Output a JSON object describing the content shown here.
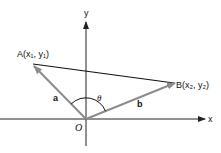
{
  "diagram": {
    "title": "",
    "axes": {
      "x_label": "x",
      "y_label": "y",
      "origin_label": "O"
    },
    "points": {
      "A": {
        "label": "A(x₁, y₁)"
      },
      "B": {
        "label": "B(x₂, y₂)"
      }
    },
    "vectors": {
      "a": {
        "label": "a",
        "from": "O",
        "to": "A"
      },
      "b": {
        "label": "b",
        "from": "O",
        "to": "B"
      }
    },
    "angle": {
      "label": "θ",
      "between": [
        "a",
        "b"
      ]
    },
    "segment_AB": {
      "from": "A",
      "to": "B"
    },
    "colors": {
      "axis": "#222222",
      "segment": "#111111",
      "vector": "#8c8c8c",
      "arc": "#111111",
      "text": "#111111"
    }
  }
}
